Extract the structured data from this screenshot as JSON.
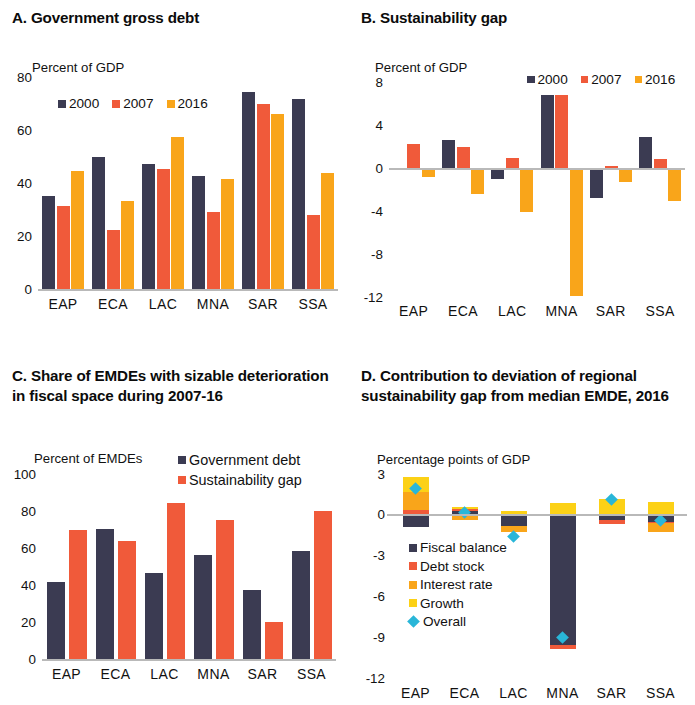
{
  "colors": {
    "navy": "#3b3b52",
    "red": "#f05a3a",
    "amber": "#f9a51a",
    "yellow": "#fcd116",
    "interest": "#f9a51a",
    "growth": "#fcd116",
    "cyan": "#29b6d8",
    "axis": "#b9b9b9"
  },
  "panelA": {
    "title": "A. Government gross debt",
    "axis_label": "Percent of GDP",
    "yticks": [
      "80",
      "60",
      "40",
      "20",
      "0"
    ],
    "categories": [
      "EAP",
      "ECA",
      "LAC",
      "MNA",
      "SAR",
      "SSA"
    ],
    "legend": [
      {
        "label": "2000",
        "color": "#3b3b52"
      },
      {
        "label": "2007",
        "color": "#f05a3a"
      },
      {
        "label": "2016",
        "color": "#f9a51a"
      }
    ]
  },
  "panelB": {
    "title": "B. Sustainability gap",
    "axis_label": "Percent of GDP",
    "yticks": [
      "8",
      "4",
      "0",
      "-4",
      "-8",
      "-12"
    ],
    "categories": [
      "EAP",
      "ECA",
      "LAC",
      "MNA",
      "SAR",
      "SSA"
    ],
    "legend": [
      {
        "label": "2000",
        "color": "#3b3b52"
      },
      {
        "label": "2007",
        "color": "#f05a3a"
      },
      {
        "label": "2016",
        "color": "#f9a51a"
      }
    ]
  },
  "panelC": {
    "title": "C. Share of EMDEs with sizable deterioration in fiscal space during 2007-16",
    "axis_label": "Percent of EMDEs",
    "yticks": [
      "100",
      "80",
      "60",
      "40",
      "20",
      "0"
    ],
    "categories": [
      "EAP",
      "ECA",
      "LAC",
      "MNA",
      "SAR",
      "SSA"
    ],
    "legend": [
      {
        "label": "Government debt",
        "color": "#3b3b52"
      },
      {
        "label": "Sustainability gap",
        "color": "#f05a3a"
      }
    ]
  },
  "panelD": {
    "title": "D. Contribution to deviation of regional sustainability gap from median EMDE, 2016",
    "axis_label": "Percentage points of GDP",
    "yticks": [
      "3",
      "0",
      "-3",
      "-6",
      "-9",
      "-12"
    ],
    "categories": [
      "EAP",
      "ECA",
      "LAC",
      "MNA",
      "SAR",
      "SSA"
    ],
    "legend": [
      {
        "label": "Fiscal balance",
        "color": "#3b3b52",
        "marker": "square"
      },
      {
        "label": "Debt stock",
        "color": "#f05a3a",
        "marker": "square"
      },
      {
        "label": "Interest rate",
        "color": "#f9a51a",
        "marker": "square"
      },
      {
        "label": "Growth",
        "color": "#fcd116",
        "marker": "square"
      },
      {
        "label": "Overall",
        "color": "#29b6d8",
        "marker": "diamond"
      }
    ]
  },
  "chart_data": [
    {
      "type": "bar",
      "title": "A. Government gross debt",
      "ylabel": "Percent of GDP",
      "xlabel": "",
      "ylim": [
        0,
        80
      ],
      "yticks": [
        0,
        20,
        40,
        60,
        80
      ],
      "grid": false,
      "legend_position": "top-left",
      "categories": [
        "EAP",
        "ECA",
        "LAC",
        "MNA",
        "SAR",
        "SSA"
      ],
      "series": [
        {
          "name": "2000",
          "color": "#3b3b52",
          "values": [
            35.2,
            49.8,
            47.3,
            42.5,
            74.5,
            71.6
          ]
        },
        {
          "name": "2007",
          "color": "#f05a3a",
          "values": [
            31.2,
            22.4,
            45.1,
            28.9,
            69.8,
            27.8
          ]
        },
        {
          "name": "2016",
          "color": "#f9a51a",
          "values": [
            44.6,
            33.3,
            57.5,
            41.6,
            66.0,
            43.8
          ]
        }
      ]
    },
    {
      "type": "bar",
      "title": "B. Sustainability gap",
      "ylabel": "Percent of GDP",
      "xlabel": "",
      "ylim": [
        -12,
        8
      ],
      "yticks": [
        -12,
        -8,
        -4,
        0,
        4,
        8
      ],
      "grid": false,
      "legend_position": "top-right",
      "categories": [
        "EAP",
        "ECA",
        "LAC",
        "MNA",
        "SAR",
        "SSA"
      ],
      "series": [
        {
          "name": "2000",
          "color": "#3b3b52",
          "values": [
            0.0,
            2.6,
            -1.0,
            6.8,
            -2.8,
            2.9
          ]
        },
        {
          "name": "2007",
          "color": "#f05a3a",
          "values": [
            2.2,
            2.0,
            0.9,
            6.8,
            0.15,
            0.8
          ]
        },
        {
          "name": "2016",
          "color": "#f9a51a",
          "values": [
            -0.8,
            -2.4,
            -4.1,
            -11.9,
            -1.3,
            -3.1
          ]
        }
      ]
    },
    {
      "type": "bar",
      "title": "C. Share of EMDEs with sizable deterioration in fiscal space during 2007-16",
      "ylabel": "Percent of EMDEs",
      "xlabel": "",
      "ylim": [
        0,
        100
      ],
      "yticks": [
        0,
        20,
        40,
        60,
        80,
        100
      ],
      "grid": false,
      "legend_position": "top-right",
      "categories": [
        "EAP",
        "ECA",
        "LAC",
        "MNA",
        "SAR",
        "SSA"
      ],
      "series": [
        {
          "name": "Government debt",
          "color": "#3b3b52",
          "values": [
            41.5,
            70.5,
            46.5,
            56.0,
            37.5,
            58.5
          ]
        },
        {
          "name": "Sustainability gap",
          "color": "#f05a3a",
          "values": [
            70.0,
            64.0,
            84.5,
            75.0,
            20.0,
            80.0
          ]
        }
      ]
    },
    {
      "type": "bar",
      "title": "D. Contribution to deviation of regional sustainability gap from median EMDE, 2016",
      "ylabel": "Percentage points of GDP",
      "xlabel": "",
      "ylim": [
        -12,
        3
      ],
      "yticks": [
        -12,
        -9,
        -6,
        -3,
        0,
        3
      ],
      "grid": false,
      "stacked": true,
      "legend_position": "inside-left",
      "categories": [
        "EAP",
        "ECA",
        "LAC",
        "MNA",
        "SAR",
        "SSA"
      ],
      "series": [
        {
          "name": "Fiscal balance",
          "color": "#3b3b52",
          "values": [
            -0.9,
            0.25,
            -0.8,
            -9.6,
            -0.35,
            -0.5
          ]
        },
        {
          "name": "Debt stock",
          "color": "#f05a3a",
          "values": [
            0.35,
            0.2,
            -0.05,
            -0.25,
            -0.3,
            -0.1
          ]
        },
        {
          "name": "Interest rate",
          "color": "#f9a51a",
          "values": [
            1.35,
            -0.35,
            -0.45,
            0.0,
            0.05,
            -0.7
          ]
        },
        {
          "name": "Growth",
          "color": "#fcd116",
          "values": [
            1.1,
            0.15,
            0.25,
            0.9,
            1.1,
            0.95
          ]
        }
      ],
      "overlay": {
        "name": "Overall",
        "color": "#29b6d8",
        "marker": "diamond",
        "values": [
          1.9,
          0.15,
          -1.6,
          -9.0,
          1.1,
          -0.4
        ]
      }
    }
  ]
}
